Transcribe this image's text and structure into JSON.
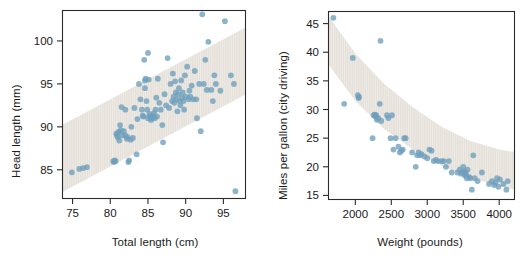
{
  "figure": {
    "background": "#ffffff",
    "point_color": "#6e9fbd",
    "band_color": "#e5e1da",
    "axis_color": "#2b2b2b",
    "text_color": "#1a1a1a"
  },
  "chart_data": [
    {
      "type": "scatter",
      "title": "",
      "xlabel": "Total length (cm)",
      "ylabel": "Head length (mm)",
      "xlim": [
        73.6,
        98.0
      ],
      "ylim": [
        81.6,
        103.6
      ],
      "xticks": [
        75,
        80,
        85,
        90,
        95
      ],
      "yticks": [
        85,
        90,
        95,
        100
      ],
      "grid": false,
      "legend": "none",
      "annotations": [
        "shaded diagonal prediction band following the positive linear trend"
      ],
      "band": {
        "kind": "linear-interval",
        "lower": [
          [
            73.6,
            82.4
          ],
          [
            98.0,
            93.8
          ]
        ],
        "upper": [
          [
            73.6,
            90.2
          ],
          [
            98.0,
            101.6
          ]
        ]
      },
      "x": [
        74.9,
        75.9,
        76.4,
        76.9,
        80.4,
        80.5,
        80.6,
        80.7,
        80.8,
        80.9,
        81.0,
        81.1,
        81.2,
        81.3,
        81.4,
        81.5,
        81.6,
        81.8,
        82.0,
        82.2,
        82.3,
        82.4,
        82.5,
        82.7,
        82.8,
        83.0,
        83.2,
        83.5,
        83.6,
        83.8,
        84.0,
        84.2,
        84.3,
        84.4,
        84.5,
        84.6,
        84.7,
        84.8,
        84.9,
        85.0,
        85.1,
        85.2,
        85.3,
        85.4,
        85.5,
        85.6,
        85.7,
        85.8,
        85.9,
        86.0,
        86.1,
        86.2,
        86.3,
        86.5,
        86.7,
        86.9,
        87.0,
        87.2,
        87.4,
        87.6,
        87.8,
        88.0,
        88.2,
        88.3,
        88.4,
        88.5,
        88.6,
        88.7,
        88.8,
        88.9,
        89.0,
        89.1,
        89.2,
        89.3,
        89.4,
        89.5,
        89.6,
        89.7,
        89.8,
        89.9,
        90.0,
        90.2,
        90.4,
        90.5,
        90.6,
        90.8,
        91.0,
        91.2,
        91.4,
        91.5,
        91.8,
        92.0,
        92.2,
        92.4,
        92.6,
        92.8,
        93.0,
        93.4,
        93.6,
        93.8,
        94.0,
        94.6,
        95.2,
        96.0,
        96.4,
        96.6,
        82.0,
        85.0,
        84.6,
        92.5
      ],
      "y": [
        84.7,
        85.1,
        85.2,
        85.3,
        86.0,
        85.9,
        86.1,
        86.0,
        89.2,
        89.0,
        88.8,
        89.4,
        88.4,
        90.2,
        89.6,
        92.3,
        89.0,
        89.5,
        89.0,
        88.6,
        88.8,
        85.9,
        86.1,
        88.5,
        90.0,
        88.7,
        92.2,
        86.8,
        90.9,
        95.0,
        93.2,
        92.0,
        91.3,
        91.2,
        97.8,
        95.4,
        95.6,
        93.0,
        92.0,
        98.6,
        95.5,
        91.5,
        91.2,
        90.8,
        91.0,
        91.1,
        91.3,
        91.6,
        91.0,
        92.0,
        93.4,
        91.2,
        95.6,
        92.8,
        92.0,
        90.2,
        88.2,
        93.8,
        92.5,
        98.0,
        92.2,
        95.0,
        93.0,
        96.2,
        93.5,
        92.8,
        95.3,
        94.0,
        93.2,
        91.8,
        93.8,
        94.5,
        93.0,
        92.5,
        95.4,
        93.4,
        94.0,
        93.0,
        92.0,
        96.0,
        93.5,
        97.0,
        93.2,
        94.2,
        93.5,
        94.8,
        93.2,
        96.5,
        93.2,
        91.0,
        95.0,
        89.5,
        103.1,
        95.0,
        97.8,
        94.3,
        99.9,
        94.3,
        93.0,
        96.0,
        95.0,
        94.2,
        102.3,
        96.0,
        95.0,
        82.5,
        92.0,
        91.0,
        94.5
      ]
    },
    {
      "type": "scatter",
      "title": "",
      "xlabel": "Weight (pounds)",
      "ylabel": "Miles per gallon (city driving)",
      "xlim": [
        1620,
        4220
      ],
      "ylim": [
        14.2,
        47.2
      ],
      "xticks": [
        2000,
        2500,
        3000,
        3500,
        4000
      ],
      "yticks": [
        15,
        20,
        25,
        30,
        35,
        40,
        45
      ],
      "grid": false,
      "legend": "none",
      "annotations": [
        "shaded curved prediction band following the decreasing nonlinear trend"
      ],
      "band": {
        "kind": "curved-interval",
        "lower_points": [
          [
            1620,
            38.0
          ],
          [
            2000,
            31.5
          ],
          [
            2400,
            26.6
          ],
          [
            2800,
            23.0
          ],
          [
            3200,
            20.2
          ],
          [
            3600,
            18.1
          ],
          [
            4000,
            16.6
          ],
          [
            4220,
            16.0
          ]
        ],
        "upper_points": [
          [
            1620,
            46.4
          ],
          [
            2000,
            39.8
          ],
          [
            2400,
            34.5
          ],
          [
            2800,
            30.4
          ],
          [
            3200,
            27.0
          ],
          [
            3600,
            24.5
          ],
          [
            4000,
            23.0
          ],
          [
            4220,
            22.6
          ]
        ]
      },
      "x": [
        1695,
        1845,
        1965,
        2035,
        2045,
        2050,
        2240,
        2255,
        2270,
        2280,
        2290,
        2300,
        2320,
        2340,
        2350,
        2360,
        2440,
        2460,
        2490,
        2510,
        2530,
        2560,
        2600,
        2620,
        2640,
        2660,
        2680,
        2700,
        2790,
        2840,
        2860,
        2880,
        2900,
        2920,
        2960,
        3000,
        3030,
        3060,
        3090,
        3120,
        3150,
        3200,
        3230,
        3260,
        3300,
        3340,
        3420,
        3450,
        3470,
        3490,
        3500,
        3510,
        3520,
        3530,
        3540,
        3550,
        3560,
        3580,
        3600,
        3620,
        3640,
        3660,
        3700,
        3760,
        3860,
        3900,
        3930,
        3950,
        3970,
        3990,
        4010,
        4060,
        4100,
        4120
      ],
      "y": [
        46.0,
        31.0,
        39.0,
        32.5,
        32.0,
        32.2,
        25.0,
        29.0,
        29.1,
        28.8,
        29.0,
        28.2,
        28.5,
        31.0,
        42.0,
        28.0,
        29.0,
        28.5,
        25.0,
        29.0,
        23.0,
        25.0,
        23.5,
        22.5,
        22.8,
        23.0,
        25.0,
        25.0,
        22.5,
        20.0,
        22.0,
        22.5,
        22.0,
        22.2,
        21.8,
        21.5,
        23.0,
        22.8,
        21.0,
        21.2,
        21.0,
        21.0,
        21.0,
        20.0,
        21.0,
        19.0,
        19.0,
        19.5,
        18.8,
        19.0,
        20.0,
        19.2,
        18.5,
        19.0,
        18.6,
        18.0,
        19.5,
        18.2,
        18.0,
        16.0,
        22.0,
        18.0,
        17.5,
        19.0,
        17.0,
        17.5,
        16.8,
        17.2,
        18.0,
        16.5,
        17.8,
        17.0,
        16.0,
        17.5
      ]
    }
  ]
}
